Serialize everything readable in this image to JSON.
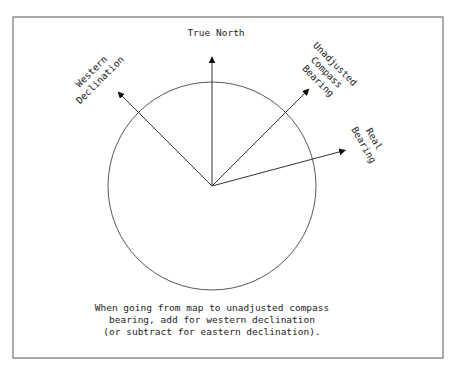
{
  "diagram": {
    "colors": {
      "stroke": "#333333",
      "frame": "#555555",
      "text": "#222222",
      "background": "#ffffff"
    },
    "arrows": [
      {
        "id": "true-north",
        "bearing_deg": 0,
        "label_lines": [
          "True North"
        ]
      },
      {
        "id": "western-declination",
        "bearing_deg": -45,
        "label_lines": [
          "Western",
          "Declination"
        ]
      },
      {
        "id": "unadjusted-compass-bearing",
        "bearing_deg": 45,
        "label_lines": [
          "Unadjusted",
          "Compass",
          "Bearing"
        ]
      },
      {
        "id": "real-bearing",
        "bearing_deg": 75,
        "label_lines": [
          "Real",
          "Bearing"
        ]
      }
    ],
    "caption_lines": [
      "When going from map to unadjusted compass",
      "bearing, add for western declination",
      "(or subtract for eastern declination)."
    ]
  }
}
